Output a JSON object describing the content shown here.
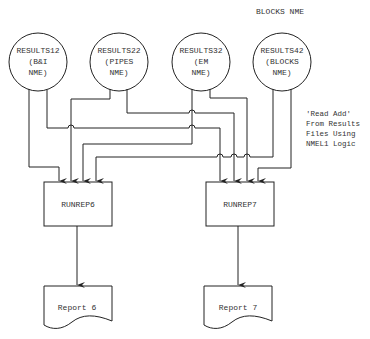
{
  "header": {
    "label": "BLOCKS NME"
  },
  "sources": [
    {
      "id": "results12",
      "lines": [
        "RESULTS12",
        "(B&I",
        "NME)"
      ]
    },
    {
      "id": "results22",
      "lines": [
        "RESULTS22",
        "(PIPES",
        "NME)"
      ]
    },
    {
      "id": "results32",
      "lines": [
        "RESULTS32",
        "(EM",
        "NME)"
      ]
    },
    {
      "id": "results42",
      "lines": [
        "RESULTS42",
        "(BLOCKS",
        "NME)"
      ]
    }
  ],
  "processes": [
    {
      "id": "runrep6",
      "label": "RUNREP6"
    },
    {
      "id": "runrep7",
      "label": "RUNREP7"
    }
  ],
  "outputs": [
    {
      "id": "report6",
      "label": "Report 6"
    },
    {
      "id": "report7",
      "label": "Report 7"
    }
  ],
  "annotation": {
    "lines": [
      "'Read Add'",
      "From Results",
      "Files Using",
      "NMEL1 Logic"
    ]
  },
  "colors": {
    "stroke": "#222222",
    "background": "#ffffff"
  }
}
